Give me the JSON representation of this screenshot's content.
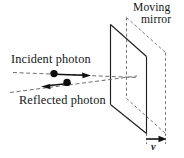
{
  "figure": {
    "background_color": "#ffffff",
    "ink_color": "#1a1a1a",
    "dash_color": "#777777",
    "width": 184,
    "height": 158,
    "labels": {
      "incident_photon": "Incident photon",
      "reflected_photon": "Reflected photon",
      "moving": "Moving",
      "mirror": "mirror",
      "velocity": "v"
    },
    "elements": {
      "mirror_solid_name": "mirror current position",
      "mirror_dashed_name": "mirror displaced position",
      "incident_ray_name": "incident photon ray",
      "reflected_ray_name": "reflected photon ray",
      "photon_incident_name": "incident photon particle",
      "photon_reflected_name": "reflected photon particle",
      "velocity_arrow_name": "mirror velocity arrow"
    }
  }
}
